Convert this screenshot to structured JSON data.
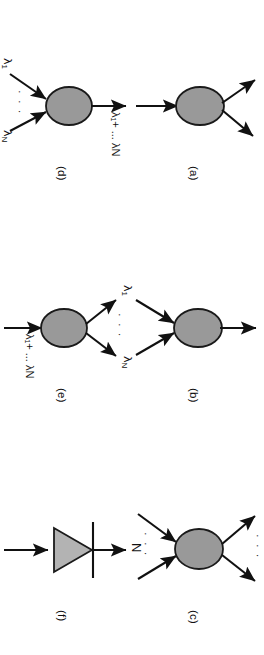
{
  "figure": {
    "orientation": "rotated-90-clockwise",
    "background_color": "#ffffff",
    "line_color": "#111111",
    "blob_fill": "#999999",
    "blob_stroke": "#1a1a1a",
    "triangle_fill": "#b3b3b3",
    "triangle_stroke": "#1a1a1a",
    "ellipsis": "· · ·",
    "columns": 3,
    "rows": 2
  },
  "panels": [
    {
      "id": "a",
      "caption": "(a)",
      "inputs": 1,
      "outputs": 2,
      "shape": "blob",
      "input_labels": [],
      "output_labels": []
    },
    {
      "id": "b",
      "caption": "(b)",
      "inputs": 2,
      "outputs": 1,
      "shape": "blob",
      "input_labels": [],
      "output_labels": []
    },
    {
      "id": "c",
      "caption": "(c)",
      "inputs": 2,
      "outputs": 2,
      "shape": "blob",
      "multiplicity_label": "N",
      "input_labels": [],
      "output_labels": []
    },
    {
      "id": "d",
      "caption": "(d)",
      "inputs": 2,
      "outputs": 1,
      "shape": "blob",
      "input_label_first": "λ",
      "input_label_first_sub": "1",
      "input_label_last": "λ",
      "input_label_last_sub": "N",
      "output_label": "λ₁+ ... λN"
    },
    {
      "id": "e",
      "caption": "(e)",
      "inputs": 1,
      "outputs": 2,
      "shape": "blob",
      "input_label": "λ₁+ ... λN",
      "output_label_first": "λ",
      "output_label_first_sub": "1",
      "output_label_last": "λ",
      "output_label_last_sub": "N"
    },
    {
      "id": "f",
      "caption": "(f)",
      "inputs": 1,
      "outputs": 1,
      "shape": "triangle-with-bar",
      "input_labels": [],
      "output_labels": []
    }
  ],
  "labels": {
    "lambda": "λ",
    "sub_one": "1",
    "sub_n": "N",
    "plus_ellipsis": "+ ... ",
    "sum_label": "λ1+ ... λN",
    "n_label": "N",
    "ellipsis": "· · ·"
  }
}
